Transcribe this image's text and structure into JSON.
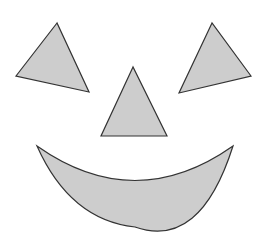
{
  "figure": {
    "width": 260,
    "height": 239,
    "colors": {
      "background": "#ffffff",
      "fill": "#cdcdcd",
      "stroke": "#333333"
    },
    "shapes": {
      "left_eye": {
        "type": "triangle",
        "points": "57,23 16,76 89,92"
      },
      "right_eye": {
        "type": "triangle",
        "points": "212,23 179,93 251,76"
      },
      "nose": {
        "type": "triangle",
        "points": "133,67 101,136 167,136"
      },
      "mouth": {
        "type": "crescent",
        "path": "M37,146 Q135,215 233,146 Q200,250 135,227 Q70,220 37,146 Z"
      }
    }
  }
}
